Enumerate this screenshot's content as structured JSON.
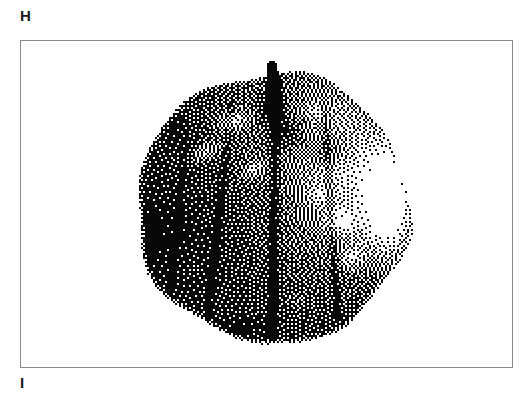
{
  "figure": {
    "panel_label_top": "H",
    "panel_label_bottom": "I",
    "background_color": "#ffffff",
    "ink_color": "#000000",
    "frame_color": "#8c8c8c",
    "frame": {
      "x": 20,
      "y": 40,
      "width": 493,
      "height": 328,
      "border_width": 1
    },
    "label_top_position": {
      "x": 20,
      "y": 8
    },
    "label_bottom_position": {
      "x": 20,
      "y": 375
    },
    "rendering": {
      "style": "error-diffusion-dither",
      "mode": "bitonal",
      "dot_size_px": 2,
      "description": "Halftone/dithered monochrome photograph of a round fruit with a short stem, shown on a white field inside a thin rectangular rule."
    },
    "subject": {
      "name": "round-fruit",
      "description": "Tomato-like round fruit, dark body, specular highlight on right flank, lobed shading bands, short stem at top",
      "center": {
        "x": 274,
        "y": 208
      },
      "radius_x": 142,
      "radius_y": 140,
      "edge_softness": 9,
      "bounds": {
        "left": 132,
        "top": 68,
        "right": 416,
        "bottom": 348
      },
      "stem": {
        "present": true,
        "tip": {
          "x": 272,
          "y": 66
        },
        "base": {
          "x": 276,
          "y": 112
        },
        "half_width": 7,
        "darkness": 0.92
      },
      "base_darkness": 0.78,
      "shading": {
        "light_direction": "upper-right",
        "specular_highlight": {
          "cx": 388,
          "cy": 205,
          "rx": 46,
          "ry": 96,
          "strength": 0.95
        },
        "ambient_rim_light": {
          "cx": 346,
          "cy": 178,
          "rx": 78,
          "ry": 120,
          "strength": 0.34
        },
        "terminator_shadow": {
          "cx": 176,
          "cy": 232,
          "rx": 110,
          "ry": 150,
          "strength": 0.3
        }
      },
      "highlight_patches": [
        {
          "cx": 233,
          "cy": 122,
          "rx": 26,
          "ry": 16,
          "strength": 0.52,
          "angle": -22
        },
        {
          "cx": 206,
          "cy": 152,
          "rx": 30,
          "ry": 14,
          "strength": 0.46,
          "angle": -28
        },
        {
          "cx": 254,
          "cy": 170,
          "rx": 22,
          "ry": 13,
          "strength": 0.4,
          "angle": -30
        },
        {
          "cx": 316,
          "cy": 112,
          "rx": 20,
          "ry": 14,
          "strength": 0.3,
          "angle": 18
        },
        {
          "cx": 341,
          "cy": 222,
          "rx": 24,
          "ry": 22,
          "strength": 0.56,
          "angle": 10
        },
        {
          "cx": 352,
          "cy": 258,
          "rx": 18,
          "ry": 20,
          "strength": 0.44,
          "angle": 6
        },
        {
          "cx": 318,
          "cy": 196,
          "rx": 16,
          "ry": 18,
          "strength": 0.3,
          "angle": 0
        },
        {
          "cx": 298,
          "cy": 300,
          "rx": 16,
          "ry": 12,
          "strength": 0.18,
          "angle": 0
        },
        {
          "cx": 196,
          "cy": 268,
          "rx": 14,
          "ry": 18,
          "strength": 0.14,
          "angle": 0
        }
      ],
      "shadow_patches": [
        {
          "cx": 286,
          "cy": 132,
          "rx": 34,
          "ry": 30,
          "strength": 0.4
        },
        {
          "cx": 330,
          "cy": 150,
          "rx": 34,
          "ry": 26,
          "strength": 0.34
        },
        {
          "cx": 268,
          "cy": 108,
          "rx": 18,
          "ry": 26,
          "strength": 0.42
        },
        {
          "cx": 176,
          "cy": 128,
          "rx": 30,
          "ry": 24,
          "strength": 0.18
        },
        {
          "cx": 236,
          "cy": 330,
          "rx": 56,
          "ry": 22,
          "strength": 0.22
        },
        {
          "cx": 150,
          "cy": 240,
          "rx": 26,
          "ry": 60,
          "strength": 0.16
        }
      ],
      "lobe_creases": [
        {
          "x0": 276,
          "y0": 96,
          "x1": 272,
          "y1": 336,
          "width": 7,
          "strength": 0.36
        },
        {
          "x0": 232,
          "y0": 104,
          "x1": 206,
          "y1": 330,
          "width": 6,
          "strength": 0.2
        },
        {
          "x0": 324,
          "y0": 108,
          "x1": 338,
          "y1": 320,
          "width": 6,
          "strength": 0.26
        },
        {
          "x0": 186,
          "y0": 140,
          "x1": 170,
          "y1": 296,
          "width": 5,
          "strength": 0.14
        }
      ],
      "texture": {
        "grain_amplitude": 0.085,
        "grain_scale": 7.5,
        "noise_seed": 20231
      }
    }
  }
}
